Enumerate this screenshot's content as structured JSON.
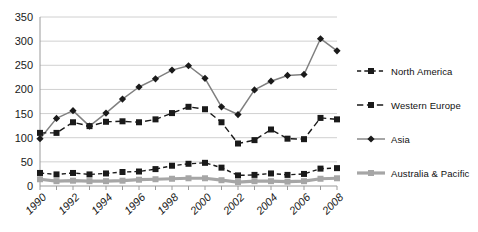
{
  "chart_data": {
    "type": "line",
    "title": "",
    "xlabel": "",
    "ylabel": "",
    "x": [
      1990,
      1991,
      1992,
      1993,
      1994,
      1995,
      1996,
      1997,
      1998,
      1999,
      2000,
      2001,
      2002,
      2003,
      2004,
      2005,
      2006,
      2007,
      2008
    ],
    "xlim": [
      1990,
      2008
    ],
    "ylim": [
      0,
      350
    ],
    "yticks": [
      0,
      50,
      100,
      150,
      200,
      250,
      300,
      350
    ],
    "xticks": [
      1990,
      1992,
      1994,
      1996,
      1998,
      2000,
      2002,
      2004,
      2006,
      2008
    ],
    "xtick_labels": [
      "1990",
      "1992",
      "1994",
      "1996",
      "1998",
      "2000",
      "2002",
      "2004",
      "2006",
      "2008"
    ],
    "ytick_labels": [
      "0",
      "50",
      "100",
      "150",
      "200",
      "250",
      "300",
      "350"
    ],
    "grid": "horizontal",
    "legend_position": "right",
    "series": [
      {
        "name": "North  America",
        "color": "#1a1a1a",
        "line_style": "dotted",
        "marker": "square",
        "values": [
          27,
          24,
          27,
          24,
          26,
          29,
          30,
          35,
          42,
          46,
          48,
          38,
          22,
          23,
          26,
          23,
          25,
          36,
          37
        ]
      },
      {
        "name": "Western  Europe",
        "color": "#1a1a1a",
        "line_style": "dashed",
        "marker": "square",
        "values": [
          110,
          110,
          132,
          124,
          133,
          134,
          132,
          138,
          151,
          164,
          159,
          132,
          88,
          95,
          117,
          98,
          97,
          141,
          138
        ]
      },
      {
        "name": "Asia",
        "color": "#808080",
        "line_style": "solid",
        "marker": "diamond",
        "values": [
          98,
          140,
          156,
          124,
          151,
          180,
          205,
          222,
          240,
          249,
          223,
          164,
          148,
          199,
          217,
          229,
          231,
          305,
          280
        ]
      },
      {
        "name": "Australia & Pacific",
        "color": "#a6a6a6",
        "line_style": "solid",
        "marker": "square",
        "values": [
          14,
          10,
          11,
          10,
          10,
          11,
          13,
          14,
          15,
          16,
          16,
          12,
          8,
          10,
          10,
          9,
          10,
          15,
          16
        ]
      }
    ]
  },
  "axis": {
    "gridline_color": "#d0d0d0",
    "axis_color": "#9a9a9a",
    "tick_label_color": "#1a1a1a"
  }
}
